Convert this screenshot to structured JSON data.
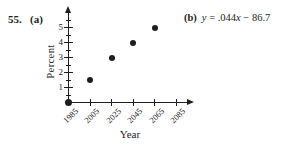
{
  "page": {
    "background": "#ffffff",
    "ink": "#1d1d1d"
  },
  "problem": {
    "number": "55.",
    "part_a_label": "(a)",
    "part_b_label": "(b)"
  },
  "equation": {
    "var_y": "y",
    "mid": " = .044",
    "var_x": "x",
    "tail": " − 86.7"
  },
  "chart_data": {
    "type": "scatter",
    "title": "",
    "xlabel": "Year",
    "ylabel": "Percent",
    "points": [
      {
        "x": 1985,
        "y": 0
      },
      {
        "x": 2005,
        "y": 1.5
      },
      {
        "x": 2025,
        "y": 3
      },
      {
        "x": 2045,
        "y": 4
      },
      {
        "x": 2065,
        "y": 5
      }
    ],
    "x_tick_years": [
      1985,
      2005,
      2025,
      2045,
      2065,
      2085
    ],
    "x_tick_labels": [
      "1985",
      "2005",
      "2025",
      "2045",
      "2065",
      "2085"
    ],
    "y_tick_values": [
      1,
      2,
      3,
      4,
      5
    ],
    "y_tick_labels": [
      "1",
      "2",
      "3",
      "4",
      "5"
    ],
    "y_minor_tick_values": [
      0.5,
      1.5,
      2.5,
      3.5,
      4.5,
      5.5
    ],
    "xlim": [
      1985,
      2100
    ],
    "ylim": [
      0,
      6
    ],
    "grid": false,
    "legend": false,
    "marker": "filled-circle",
    "marker_color": "#1d1d1d",
    "axis_color": "#1d1d1d"
  }
}
